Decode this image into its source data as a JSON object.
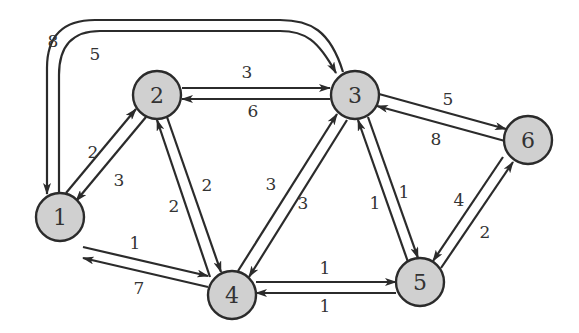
{
  "diagram": {
    "type": "directed-weighted-graph",
    "node_fill": "#d0d0d0",
    "stroke": "#2b2b2b",
    "nodes": [
      {
        "id": "1",
        "label": "1",
        "x": 60,
        "y": 217
      },
      {
        "id": "2",
        "label": "2",
        "x": 157,
        "y": 95
      },
      {
        "id": "3",
        "label": "3",
        "x": 355,
        "y": 95
      },
      {
        "id": "4",
        "label": "4",
        "x": 232,
        "y": 295
      },
      {
        "id": "5",
        "label": "5",
        "x": 420,
        "y": 282
      },
      {
        "id": "6",
        "label": "6",
        "x": 528,
        "y": 140
      }
    ],
    "edges": [
      {
        "from": "1",
        "to": "3",
        "weight": "5",
        "route": "arc-inner"
      },
      {
        "from": "3",
        "to": "1",
        "weight": "8",
        "route": "arc-outer"
      },
      {
        "from": "1",
        "to": "2",
        "weight": "2"
      },
      {
        "from": "2",
        "to": "1",
        "weight": "3"
      },
      {
        "from": "2",
        "to": "3",
        "weight": "3"
      },
      {
        "from": "3",
        "to": "2",
        "weight": "6"
      },
      {
        "from": "2",
        "to": "4",
        "weight": "2"
      },
      {
        "from": "4",
        "to": "2",
        "weight": "2"
      },
      {
        "from": "4",
        "to": "3",
        "weight": "3"
      },
      {
        "from": "3",
        "to": "4",
        "weight": "3"
      },
      {
        "from": "3",
        "to": "5",
        "weight": "1"
      },
      {
        "from": "5",
        "to": "3",
        "weight": "1"
      },
      {
        "from": "3",
        "to": "6",
        "weight": "5"
      },
      {
        "from": "6",
        "to": "3",
        "weight": "8"
      },
      {
        "from": "5",
        "to": "6",
        "weight": "2"
      },
      {
        "from": "6",
        "to": "5",
        "weight": "4"
      },
      {
        "from": "1",
        "to": "4",
        "weight": "1"
      },
      {
        "from": "4",
        "to": "1",
        "weight": "7"
      },
      {
        "from": "4",
        "to": "5",
        "weight": "1"
      },
      {
        "from": "5",
        "to": "4",
        "weight": "1"
      }
    ],
    "labels": {
      "n1": "1",
      "n2": "2",
      "n3": "3",
      "n4": "4",
      "n5": "5",
      "n6": "6",
      "w_3_1": "8",
      "w_1_3": "5",
      "w_1_2": "2",
      "w_2_1": "3",
      "w_2_3": "3",
      "w_3_2": "6",
      "w_2_4": "2",
      "w_4_2": "2",
      "w_4_3": "3",
      "w_3_4": "3",
      "w_3_5": "1",
      "w_5_3": "1",
      "w_3_6": "5",
      "w_6_3": "8",
      "w_5_6": "2",
      "w_6_5": "4",
      "w_1_4": "1",
      "w_4_1": "7",
      "w_4_5": "1",
      "w_5_4": "1"
    }
  }
}
